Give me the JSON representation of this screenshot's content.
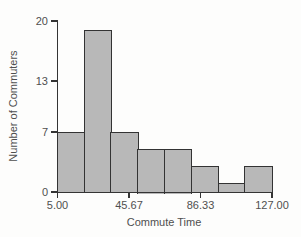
{
  "figure": {
    "background": "#fdfdfc",
    "kind": "scanned textbook histogram"
  },
  "chart_data": {
    "type": "bar",
    "subtype": "histogram",
    "title": "",
    "xlabel": "Commute Time",
    "ylabel": "Number of Commuters",
    "bin_edges": [
      5.0,
      20.25,
      35.5,
      50.75,
      66.0,
      81.25,
      96.5,
      111.75,
      127.0
    ],
    "frequencies": [
      7,
      19,
      7,
      5,
      5,
      3,
      1,
      3
    ],
    "total_count": 50,
    "x_ticks": [
      {
        "value": 5.0,
        "label": "5.00"
      },
      {
        "value": 45.67,
        "label": "45.67"
      },
      {
        "value": 86.33,
        "label": "86.33"
      },
      {
        "value": 127.0,
        "label": "127.00"
      }
    ],
    "y_ticks": [
      {
        "value": 0,
        "label": "0"
      },
      {
        "value": 7,
        "label": "7"
      },
      {
        "value": 13,
        "label": "13"
      },
      {
        "value": 20,
        "label": "20"
      }
    ],
    "xlim": [
      5.0,
      127.0
    ],
    "ylim": [
      0,
      20
    ],
    "grid": false,
    "legend": false,
    "bar_fill": "#b8b8b8",
    "bar_border": "#333333",
    "axis_color": "#343434",
    "text_color": "#4f4f4f"
  }
}
